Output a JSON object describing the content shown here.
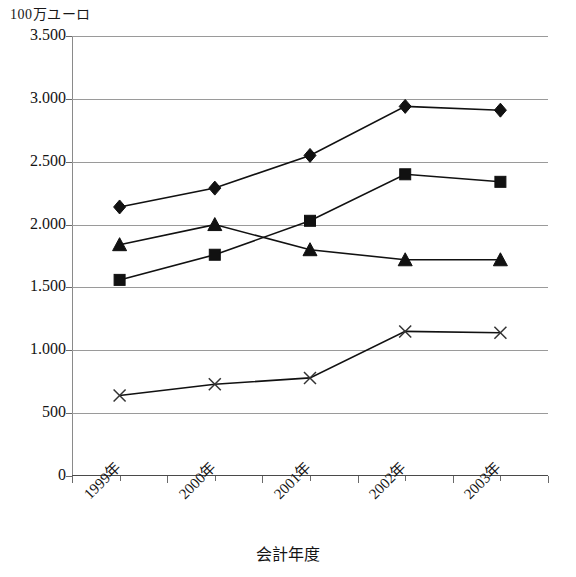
{
  "chart_data": {
    "type": "line",
    "title": "100万ユーロ",
    "xlabel": "会計年度",
    "ylabel": "100万ユーロ",
    "categories": [
      "1999年",
      "2000年",
      "2001年",
      "2002年",
      "2003年"
    ],
    "ytick_labels": [
      "3.500",
      "3.000",
      "2.500",
      "2.000",
      "1.500",
      "1.000",
      "500",
      "0"
    ],
    "ytick_values": [
      3500,
      3000,
      2500,
      2000,
      1500,
      1000,
      500,
      0
    ],
    "ylim": [
      0,
      3500
    ],
    "grid": true,
    "legend": "none",
    "series": [
      {
        "name": "diamond-series",
        "marker": "diamond",
        "color": "#111111",
        "values": [
          2140,
          2290,
          2550,
          2940,
          2910
        ]
      },
      {
        "name": "square-series",
        "marker": "square",
        "color": "#111111",
        "values": [
          1560,
          1760,
          2030,
          2400,
          2340
        ]
      },
      {
        "name": "triangle-series",
        "marker": "triangle",
        "color": "#111111",
        "values": [
          1840,
          2000,
          1800,
          1720,
          1720
        ]
      },
      {
        "name": "cross-series",
        "marker": "x",
        "color": "#333333",
        "values": [
          640,
          730,
          780,
          1150,
          1140
        ]
      }
    ]
  },
  "axis": {
    "y_title": "100万ユーロ",
    "x_title": "会計年度"
  },
  "caption": {
    "text": ""
  }
}
